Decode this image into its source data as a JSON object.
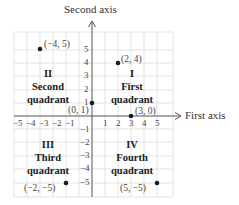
{
  "axes": {
    "x_title": "First axis",
    "y_title": "Second axis"
  },
  "ticks": {
    "x_neg": [
      "−5",
      "−4",
      "−3",
      "−2",
      "−1"
    ],
    "x_pos": [
      "1",
      "2",
      "3",
      "4",
      "5"
    ],
    "y_pos": [
      "5",
      "4",
      "3",
      "2",
      "1"
    ],
    "y_neg": [
      "−1",
      "−2",
      "−3",
      "−4",
      "−5"
    ]
  },
  "quadrants": {
    "q1": {
      "numeral": "I",
      "name": "First",
      "word": "quadrant"
    },
    "q2": {
      "numeral": "II",
      "name": "Second",
      "word": "quadrant"
    },
    "q3": {
      "numeral": "III",
      "name": "Third",
      "word": "quadrant"
    },
    "q4": {
      "numeral": "IV",
      "name": "Fourth",
      "word": "quadrant"
    }
  },
  "points": [
    {
      "label": "(−4, 5)",
      "x": -4,
      "y": 5
    },
    {
      "label": "(2, 4)",
      "x": 2,
      "y": 4
    },
    {
      "label": "(0, 1)",
      "x": 0,
      "y": 1
    },
    {
      "label": "(3, 0)",
      "x": 3,
      "y": 0
    },
    {
      "label": "(−2, −5)",
      "x": -2,
      "y": -5
    },
    {
      "label": "(5, −5)",
      "x": 5,
      "y": -5
    }
  ],
  "colors": {
    "grid": "#d9d9d9",
    "axis": "#555555",
    "point": "#1a1a1a",
    "text": "#222222"
  }
}
